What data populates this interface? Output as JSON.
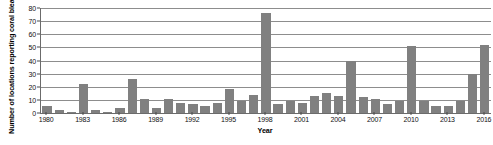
{
  "chart_data": {
    "type": "bar",
    "title": "",
    "xlabel": "Year",
    "ylabel": "Number of locations reporting coral bleaching",
    "ylim": [
      0,
      80
    ],
    "ytick_step": 10,
    "yticks": [
      0,
      10,
      20,
      30,
      40,
      50,
      60,
      70,
      80
    ],
    "xticks": [
      "1980",
      "1983",
      "1986",
      "1989",
      "1992",
      "1995",
      "1998",
      "2001",
      "2004",
      "2007",
      "2010",
      "2013",
      "2016"
    ],
    "grid": true,
    "legend": null,
    "bar_color": "#808080",
    "axis_color": "#6b6b6b",
    "gridline_color": "#8d8d8d",
    "categories": [
      "1980",
      "1981",
      "1982",
      "1983",
      "1984",
      "1985",
      "1986",
      "1987",
      "1988",
      "1989",
      "1990",
      "1991",
      "1992",
      "1993",
      "1994",
      "1995",
      "1996",
      "1997",
      "1998",
      "1999",
      "2000",
      "2001",
      "2002",
      "2003",
      "2004",
      "2005",
      "2006",
      "2007",
      "2008",
      "2009",
      "2010",
      "2011",
      "2012",
      "2013",
      "2014",
      "2015",
      "2016"
    ],
    "values": [
      5,
      2,
      1,
      22,
      2,
      1,
      4,
      26,
      11,
      4,
      11,
      8,
      7,
      5,
      8,
      18,
      9,
      14,
      76,
      7,
      9,
      8,
      13,
      15,
      13,
      40,
      12,
      11,
      7,
      9,
      51,
      9,
      5,
      5,
      9,
      30,
      52
    ]
  }
}
